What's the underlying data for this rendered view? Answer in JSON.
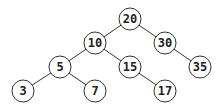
{
  "diagram": {
    "type": "binary-search-tree",
    "colors": {
      "stroke": "#333333",
      "fill": "#ffffff",
      "text": "#222222"
    },
    "radius": 11,
    "nodes": [
      {
        "id": "n20",
        "label": "20",
        "x": 130,
        "y": 19
      },
      {
        "id": "n10",
        "label": "10",
        "x": 95,
        "y": 43
      },
      {
        "id": "n30",
        "label": "30",
        "x": 165,
        "y": 43
      },
      {
        "id": "n5",
        "label": "5",
        "x": 60,
        "y": 67
      },
      {
        "id": "n15",
        "label": "15",
        "x": 130,
        "y": 67
      },
      {
        "id": "n35",
        "label": "35",
        "x": 200,
        "y": 67
      },
      {
        "id": "n3",
        "label": "3",
        "x": 23,
        "y": 91
      },
      {
        "id": "n7",
        "label": "7",
        "x": 95,
        "y": 91
      },
      {
        "id": "n17",
        "label": "17",
        "x": 165,
        "y": 91
      }
    ],
    "edges": [
      {
        "from": "n20",
        "to": "n10"
      },
      {
        "from": "n20",
        "to": "n30"
      },
      {
        "from": "n10",
        "to": "n5"
      },
      {
        "from": "n10",
        "to": "n15"
      },
      {
        "from": "n30",
        "to": "n35"
      },
      {
        "from": "n5",
        "to": "n3"
      },
      {
        "from": "n5",
        "to": "n7"
      },
      {
        "from": "n15",
        "to": "n17"
      }
    ]
  }
}
